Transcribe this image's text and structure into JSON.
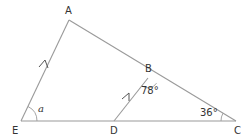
{
  "diagram": {
    "type": "geometry-triangle",
    "points": {
      "A": {
        "label": "A",
        "x": 69,
        "y": 20
      },
      "B": {
        "label": "B",
        "x": 148,
        "y": 78
      },
      "C": {
        "label": "C",
        "x": 236,
        "y": 121
      },
      "D": {
        "label": "D",
        "x": 114,
        "y": 121
      },
      "E": {
        "label": "E",
        "x": 21,
        "y": 121
      }
    },
    "segments": [
      "AE",
      "AC",
      "EC",
      "DB"
    ],
    "parallel_marks": [
      "EA",
      "DB"
    ],
    "angles": {
      "at_E": {
        "label": "a",
        "vertex": "E"
      },
      "at_B": {
        "label": "78°",
        "vertex": "B",
        "between": "BD-BC"
      },
      "at_C": {
        "label": "36°",
        "vertex": "C"
      }
    },
    "colors": {
      "line": "#9a9a9a",
      "text": "#333333",
      "arrow": "#555555",
      "background": "#ffffff"
    }
  }
}
